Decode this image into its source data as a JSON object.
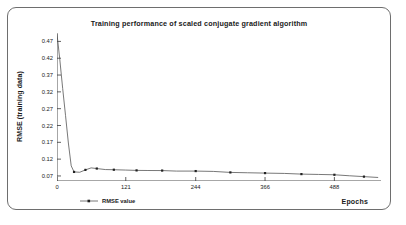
{
  "figure": {
    "border_color": "#6e6e6e",
    "background": "#ffffff"
  },
  "chart_data": {
    "type": "line",
    "title": "Training performance of scaled conjugate gradient algorithm",
    "xlabel": "Epochs",
    "ylabel": "RMSE (training data)",
    "xlim": [
      0,
      570
    ],
    "ylim": [
      0.055,
      0.495
    ],
    "grid": false,
    "legend_position": "bottom-left",
    "line_color": "#555555",
    "marker_color": "#222222",
    "xticks": [
      0,
      121,
      244,
      366,
      488
    ],
    "xtick_labels": [
      "0",
      "121",
      "244",
      "366",
      "488"
    ],
    "yticks": [
      0.07,
      0.12,
      0.17,
      0.22,
      0.27,
      0.32,
      0.37,
      0.42,
      0.47
    ],
    "ytick_labels": [
      "0.07",
      "0.12",
      "0.17",
      "0.22",
      "0.27",
      "0.32",
      "0.37",
      "0.42",
      "0.47"
    ],
    "series": [
      {
        "name": "RMSE value",
        "x": [
          0,
          5,
          10,
          15,
          20,
          25,
          30,
          40,
          50,
          60,
          70,
          85,
          100,
          121,
          140,
          160,
          185,
          210,
          244,
          275,
          305,
          335,
          366,
          400,
          430,
          460,
          488,
          515,
          540,
          565
        ],
        "values": [
          0.492,
          0.415,
          0.33,
          0.25,
          0.168,
          0.1,
          0.082,
          0.081,
          0.088,
          0.094,
          0.092,
          0.089,
          0.0885,
          0.0875,
          0.0865,
          0.0862,
          0.086,
          0.0845,
          0.0845,
          0.0835,
          0.0805,
          0.0795,
          0.0785,
          0.0775,
          0.0755,
          0.0745,
          0.0735,
          0.0705,
          0.068,
          0.0655
        ]
      }
    ],
    "legend": [
      "RMSE value"
    ]
  }
}
